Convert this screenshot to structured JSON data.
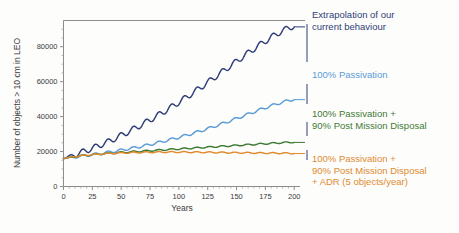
{
  "chart_data": {
    "type": "line",
    "title": "",
    "xlabel": "Years",
    "ylabel": "Number of objects > 10 cm in LEO",
    "xlim": [
      0,
      205
    ],
    "ylim": [
      0,
      95000
    ],
    "xticks": [
      "0",
      "25",
      "50",
      "75",
      "100",
      "125",
      "150",
      "175",
      "200"
    ],
    "xtick_values": [
      0,
      25,
      50,
      75,
      100,
      125,
      150,
      175,
      200
    ],
    "yticks": [
      "0",
      "20000",
      "40000",
      "60000",
      "80000"
    ],
    "ytick_values": [
      0,
      20000,
      40000,
      60000,
      80000
    ],
    "grid": false,
    "legend_position": "right-annotations",
    "oscillation_note": "all series show ~11-year solar-cycle ripple",
    "series": [
      {
        "name": "Extrapolation of our current behaviour",
        "color": "#2f3d78",
        "x": [
          0,
          10,
          20,
          30,
          40,
          50,
          60,
          70,
          80,
          90,
          100,
          110,
          120,
          130,
          140,
          150,
          160,
          170,
          180,
          190,
          200
        ],
        "values": [
          16000,
          18200,
          20600,
          23200,
          26000,
          29200,
          32600,
          36200,
          40000,
          44000,
          48200,
          52600,
          57200,
          62000,
          66800,
          71600,
          76400,
          81000,
          85400,
          89200,
          92000
        ],
        "ripple_amplitude": 1600,
        "ripple_period": 11
      },
      {
        "name": "100% Passivation",
        "color": "#5b9bd5",
        "x": [
          0,
          10,
          20,
          30,
          40,
          50,
          60,
          70,
          80,
          90,
          100,
          110,
          120,
          130,
          140,
          150,
          160,
          170,
          180,
          190,
          200
        ],
        "values": [
          16000,
          16900,
          17800,
          18700,
          19700,
          20800,
          22000,
          23300,
          24800,
          26400,
          28100,
          30000,
          32000,
          34200,
          36500,
          38900,
          41400,
          43900,
          46200,
          48300,
          50000
        ],
        "ripple_amplitude": 700,
        "ripple_period": 11
      },
      {
        "name": "100% Passivation + 90% Post Mission Disposal",
        "color": "#3d7a33",
        "x": [
          0,
          10,
          20,
          30,
          40,
          50,
          60,
          70,
          80,
          90,
          100,
          110,
          120,
          130,
          140,
          150,
          160,
          170,
          180,
          190,
          200
        ],
        "values": [
          16000,
          17100,
          17900,
          18500,
          19000,
          19500,
          19900,
          20300,
          20700,
          21100,
          21500,
          21900,
          22300,
          22700,
          23100,
          23500,
          23900,
          24300,
          24700,
          25100,
          25400
        ],
        "ripple_amplitude": 380,
        "ripple_period": 11
      },
      {
        "name": "100% Passivation + 90% Post Mission Disposal + ADR (5 objects/year)",
        "color": "#e08a2e",
        "x": [
          0,
          10,
          20,
          30,
          40,
          50,
          60,
          70,
          80,
          90,
          100,
          110,
          120,
          130,
          140,
          150,
          160,
          170,
          180,
          190,
          200
        ],
        "values": [
          16000,
          17200,
          18000,
          18500,
          18900,
          19200,
          19400,
          19550,
          19650,
          19700,
          19700,
          19650,
          19600,
          19500,
          19420,
          19330,
          19250,
          19180,
          19120,
          19070,
          19000
        ],
        "ripple_amplitude": 330,
        "ripple_period": 11
      }
    ],
    "annotations": [
      {
        "id": "annotation-extrapolation",
        "lines": [
          "Extrapolation of our",
          "current behaviour"
        ],
        "color": "#2f3d78"
      },
      {
        "id": "annotation-passivation",
        "lines": [
          "100% Passivation"
        ],
        "color": "#5b9bd5"
      },
      {
        "id": "annotation-passivation-pmd",
        "lines": [
          "100% Passivation +",
          "90% Post Mission Disposal"
        ],
        "color": "#3d7a33"
      },
      {
        "id": "annotation-passivation-pmd-adr",
        "lines": [
          "100% Passivation +",
          "90% Post Mission Disposal",
          "+ ADR (5 objects/year)"
        ],
        "color": "#e08a2e"
      }
    ]
  }
}
